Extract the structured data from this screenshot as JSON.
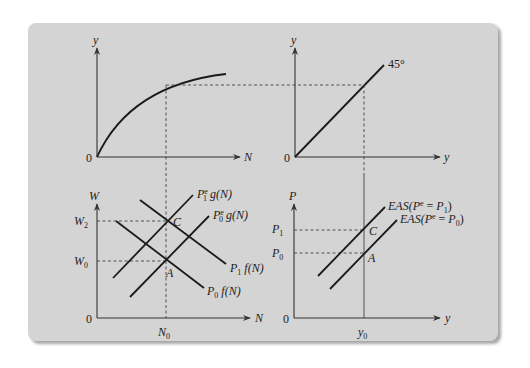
{
  "figure": {
    "panels": {
      "production": {
        "y_axis_label": "y",
        "x_axis_label": "N",
        "origin_label": "0",
        "curve": "production function (concave)"
      },
      "forty_five": {
        "y_axis_label": "y",
        "x_axis_label": "y",
        "origin_label": "0",
        "line_label": "45°"
      },
      "labor_market": {
        "y_axis_label": "W",
        "x_axis_label": "N",
        "origin_label": "0",
        "ticks_y": [
          "W2",
          "W0"
        ],
        "ticks_x": [
          "N0"
        ],
        "points": [
          "C",
          "A"
        ],
        "curves": {
          "p1g": {
            "main": "P",
            "sup": "e",
            "sub": "1",
            "rest": "g(N)"
          },
          "p0g": {
            "main": "P",
            "sup": "e",
            "sub": "0",
            "rest": "g(N)"
          },
          "p1f": {
            "main": "P",
            "sub": "1",
            "rest": "f(N)"
          },
          "p0f": {
            "main": "P",
            "sub": "0",
            "rest": "f(N)"
          }
        }
      },
      "eas": {
        "y_axis_label": "P",
        "x_axis_label": "y",
        "origin_label": "0",
        "ticks_y": [
          "P1",
          "P0"
        ],
        "ticks_x": [
          "y0"
        ],
        "points": [
          "C",
          "A"
        ],
        "curves": {
          "eas1": {
            "text": "EAS(P",
            "sup": "e",
            "mid": " = P",
            "sub": "1",
            "end": ")"
          },
          "eas0": {
            "text": "EAS(P",
            "sup": "e",
            "mid": " = P",
            "sub": "0",
            "end": ")"
          }
        }
      }
    },
    "colors": {
      "panel_bg": "#d4d4d4",
      "line": "#1a1a1a",
      "page_bg": "#ffffff"
    }
  }
}
